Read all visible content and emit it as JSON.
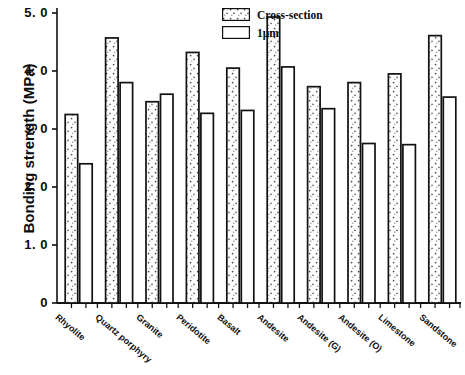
{
  "chart_data": {
    "type": "bar",
    "title": "",
    "xlabel": "",
    "ylabel": "Bonding strength (MPa)",
    "ylim": [
      0,
      5.0
    ],
    "ytick_values": [
      0,
      1.0,
      2.0,
      3.0,
      4.0,
      5.0
    ],
    "ytick_labels": [
      "0",
      "1. 0",
      "2. 0",
      "3. 0",
      "4. 0",
      "5. 0"
    ],
    "grid": false,
    "legend_position": "top-right",
    "categories": [
      "Rhyolite",
      "Quartz porphyry",
      "Granite",
      "Peridotite",
      "Basalt",
      "Andesite",
      "Andesite (G)",
      "Andesite (O)",
      "Limestone",
      "Sandstone"
    ],
    "series": [
      {
        "name": "Cross-section",
        "fill": "stippled",
        "values": [
          3.25,
          4.57,
          3.47,
          4.32,
          4.05,
          4.93,
          3.73,
          3.8,
          3.95,
          4.61
        ]
      },
      {
        "name": "1μm",
        "fill": "white",
        "values": [
          2.4,
          3.8,
          3.6,
          3.27,
          3.32,
          4.07,
          3.35,
          2.75,
          2.73,
          3.55
        ]
      }
    ],
    "colors": {
      "axis": "#111111",
      "bar_outline": "#111111",
      "series_1_fill": "#ffffff",
      "series_2_fill": "#ffffff",
      "stipple_dot": "#555555"
    }
  },
  "legend": {
    "items": [
      {
        "label": "Cross-section",
        "swatch": "stippled-swatch"
      },
      {
        "label": "1μm",
        "swatch": "white-swatch"
      }
    ]
  },
  "axes": {
    "y_title": "Bonding strength (MPa)"
  }
}
